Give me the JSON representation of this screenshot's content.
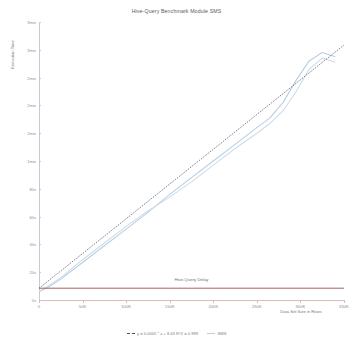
{
  "chart_data": {
    "type": "line",
    "title": "Hive-Query Benchmark Module SMS",
    "xlabel": "Data Set Size in Rows",
    "ylabel": "Execution Time",
    "xlim": [
      0,
      350000
    ],
    "ylim": [
      0,
      200
    ],
    "grid": false,
    "legend_position": "bottom",
    "xtick_values": [
      0,
      50000,
      100000,
      150000,
      200000,
      250000,
      300000,
      350000
    ],
    "xtick_labels": [
      "0",
      "50K",
      "100K",
      "150K",
      "200K",
      "250K",
      "300K",
      "350K"
    ],
    "ytick_values": [
      0,
      20,
      40,
      60,
      80,
      100,
      120,
      140,
      160,
      180,
      200
    ],
    "ytick_labels": [
      "0s",
      "20s",
      "40s",
      "60s",
      "80s",
      "1min",
      "2min",
      "2min",
      "2min",
      "3min",
      "3min"
    ],
    "annotations": [
      {
        "text": "Hive-Query Delay",
        "x": 175000,
        "y": 11,
        "color": "#6e6e78"
      }
    ],
    "series": [
      {
        "name": "SMS",
        "type": "line",
        "color": "#b9cfe4",
        "x": [
          0,
          10000,
          25000,
          50000,
          75000,
          100000,
          125000,
          150000,
          175000,
          200000,
          225000,
          250000,
          265000,
          280000,
          295000,
          310000,
          325000,
          340000
        ],
        "values": [
          6,
          9,
          15,
          27,
          39,
          51,
          63,
          76,
          88,
          100,
          112,
          124,
          131,
          142,
          158,
          172,
          178,
          175
        ]
      },
      {
        "name": "SMS run 2",
        "type": "line",
        "color": "#cfdcea",
        "x": [
          0,
          10000,
          25000,
          50000,
          75000,
          100000,
          125000,
          150000,
          175000,
          200000,
          225000,
          250000,
          265000,
          280000,
          295000,
          310000,
          325000,
          340000
        ],
        "values": [
          6,
          10,
          16,
          29,
          41,
          53,
          64,
          74,
          85,
          97,
          109,
          120,
          127,
          136,
          150,
          166,
          174,
          171
        ]
      },
      {
        "name": "y = 0.0005 * x + 8.43   R^2 = 0.999",
        "type": "trendline",
        "color": "#4a4a6a",
        "slope": 0.0005,
        "intercept": 8.43,
        "r_squared": 0.999,
        "x": [
          0,
          350000
        ],
        "values": [
          8.43,
          183.43
        ]
      },
      {
        "name": "Hive-Query Delay",
        "type": "hline",
        "color": "#a0504f",
        "x": [
          0,
          350000
        ],
        "values": [
          8.5,
          8.5
        ]
      }
    ]
  },
  "legend": {
    "items": [
      {
        "label": "y = 0.0005 * x + 8.43   R^2 = 0.999"
      },
      {
        "label": "SMS"
      }
    ]
  }
}
